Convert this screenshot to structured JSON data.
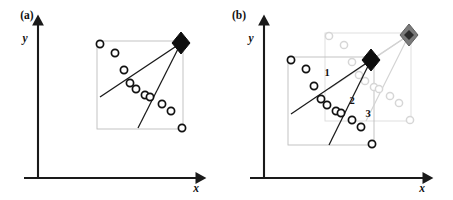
{
  "figure": {
    "width": 453,
    "height": 200,
    "background": "#ffffff",
    "colors": {
      "axis": "#1a1a1a",
      "dark_marker": "#111111",
      "ghost_marker": "#d6d6d6",
      "dark_diamond": "#0d0d0d",
      "ghost_diamond": "#7a7a7a",
      "box_dark": "#bdbdbd",
      "box_ghost": "#dcdcdc",
      "ray_dark": "#1a1a1a",
      "ray_ghost": "#d2d2d2"
    }
  },
  "panels": [
    {
      "id": "panel-a",
      "label": "(a)",
      "label_pos": [
        27,
        19
      ],
      "axes": {
        "x_label": "x",
        "y_label": "y",
        "x_label_pos": [
          196,
          189
        ],
        "y_label_pos": [
          25,
          42
        ],
        "origin": [
          38,
          178
        ],
        "x_end": [
          200,
          178
        ],
        "y_top": [
          38,
          21
        ]
      },
      "bounding_box": {
        "x": 97,
        "y": 41,
        "width": 86,
        "height": 88,
        "stroke": "#bdbdbd"
      },
      "diamond": {
        "name": "reference-diamond-black",
        "cx": 181,
        "cy": 43,
        "rx": 9,
        "ry": 11,
        "color": "#0d0d0d"
      },
      "rays": [
        {
          "name": "ray-upper",
          "x1": 181,
          "y1": 43,
          "x2": 100,
          "y2": 97
        },
        {
          "name": "ray-lower",
          "x1": 181,
          "y1": 43,
          "x2": 138,
          "y2": 128
        }
      ],
      "circles": [
        {
          "cx": 100,
          "cy": 44,
          "r": 3.6
        },
        {
          "cx": 115,
          "cy": 53,
          "r": 3.6
        },
        {
          "cx": 124,
          "cy": 70,
          "r": 3.6
        },
        {
          "cx": 130,
          "cy": 83,
          "r": 3.6
        },
        {
          "cx": 136,
          "cy": 89,
          "r": 3.6
        },
        {
          "cx": 145,
          "cy": 95,
          "r": 3.6
        },
        {
          "cx": 150,
          "cy": 97,
          "r": 3.6
        },
        {
          "cx": 162,
          "cy": 104,
          "r": 3.6
        },
        {
          "cx": 171,
          "cy": 111,
          "r": 3.6
        },
        {
          "cx": 182,
          "cy": 128,
          "r": 3.6
        }
      ],
      "circle_count": 10
    },
    {
      "id": "panel-b",
      "label": "(b)",
      "label_pos": [
        239,
        19
      ],
      "axes": {
        "x_label": "x",
        "y_label": "y",
        "x_label_pos": [
          422,
          189
        ],
        "y_label_pos": [
          251,
          42
        ],
        "origin": [
          264,
          178
        ],
        "x_end": [
          427,
          178
        ],
        "y_top": [
          264,
          21
        ]
      },
      "bounding_box_dark": {
        "x": 288,
        "y": 57,
        "width": 86,
        "height": 88,
        "stroke": "#bdbdbd"
      },
      "bounding_box_ghost": {
        "x": 325,
        "y": 33,
        "width": 86,
        "height": 88,
        "stroke": "#dcdcdc"
      },
      "diamond_dark": {
        "name": "reference-diamond-black",
        "cx": 371,
        "cy": 60,
        "rx": 9,
        "ry": 11,
        "color": "#0d0d0d"
      },
      "diamond_ghost": {
        "name": "reference-diamond-gray",
        "cx": 409,
        "cy": 35,
        "rx": 9,
        "ry": 11,
        "color": "#7a7a7a"
      },
      "rays_dark": [
        {
          "name": "ray-dark-upper",
          "x1": 371,
          "y1": 60,
          "x2": 291,
          "y2": 114
        },
        {
          "name": "ray-dark-lower",
          "x1": 371,
          "y1": 60,
          "x2": 329,
          "y2": 145
        }
      ],
      "rays_ghost": [
        {
          "name": "ray-ghost-upper",
          "x1": 409,
          "y1": 35,
          "x2": 329,
          "y2": 89
        },
        {
          "name": "ray-ghost-lower",
          "x1": 409,
          "y1": 35,
          "x2": 366,
          "y2": 121
        },
        {
          "name": "ray-link-diamonds",
          "x1": 371,
          "y1": 60,
          "x2": 409,
          "y2": 35
        }
      ],
      "circles_dark": [
        {
          "cx": 291,
          "cy": 60,
          "r": 3.6
        },
        {
          "cx": 306,
          "cy": 69,
          "r": 3.6
        },
        {
          "cx": 314,
          "cy": 86,
          "r": 3.6
        },
        {
          "cx": 321,
          "cy": 99,
          "r": 3.6
        },
        {
          "cx": 327,
          "cy": 105,
          "r": 3.6
        },
        {
          "cx": 336,
          "cy": 111,
          "r": 3.6
        },
        {
          "cx": 341,
          "cy": 113,
          "r": 3.6
        },
        {
          "cx": 352,
          "cy": 120,
          "r": 3.6
        },
        {
          "cx": 361,
          "cy": 127,
          "r": 3.6
        },
        {
          "cx": 372,
          "cy": 144,
          "r": 3.6
        }
      ],
      "circles_ghost": [
        {
          "cx": 329,
          "cy": 36,
          "r": 3.6
        },
        {
          "cx": 344,
          "cy": 45,
          "r": 3.6
        },
        {
          "cx": 352,
          "cy": 62,
          "r": 3.6
        },
        {
          "cx": 359,
          "cy": 75,
          "r": 3.6
        },
        {
          "cx": 365,
          "cy": 81,
          "r": 3.6
        },
        {
          "cx": 374,
          "cy": 87,
          "r": 3.6
        },
        {
          "cx": 379,
          "cy": 89,
          "r": 3.6
        },
        {
          "cx": 390,
          "cy": 96,
          "r": 3.6
        },
        {
          "cx": 399,
          "cy": 103,
          "r": 3.6
        },
        {
          "cx": 410,
          "cy": 120,
          "r": 3.6
        }
      ],
      "correspondence_labels": [
        {
          "text": "1",
          "x": 327,
          "y": 76
        },
        {
          "text": "2",
          "x": 352,
          "y": 104
        },
        {
          "text": "3",
          "x": 368,
          "y": 117
        }
      ],
      "circle_count_dark": 10,
      "circle_count_ghost": 10
    }
  ]
}
